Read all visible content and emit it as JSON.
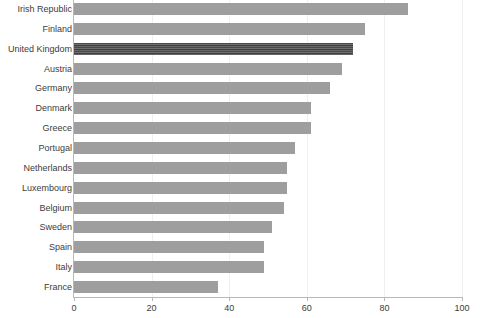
{
  "chart_data": {
    "type": "bar",
    "orientation": "horizontal",
    "title": "",
    "subtitle": "",
    "xlabel": "",
    "ylabel": "",
    "xlim": [
      0,
      100
    ],
    "ylim": null,
    "grid": true,
    "legend": null,
    "legend_position": "none",
    "xticks": [
      0,
      20,
      40,
      60,
      80,
      100
    ],
    "xtick_labels": [
      "0",
      "20",
      "40",
      "60",
      "80",
      "100"
    ],
    "categories": [
      "Irish Republic",
      "Finland",
      "United Kingdom",
      "Austria",
      "Germany",
      "Denmark",
      "Greece",
      "Portugal",
      "Netherlands",
      "Luxembourg",
      "Belgium",
      "Sweden",
      "Spain",
      "Italy",
      "France"
    ],
    "values": [
      86,
      75,
      72,
      69,
      66,
      61,
      61,
      57,
      55,
      55,
      54,
      51,
      49,
      49,
      37
    ],
    "highlighted_category": "United Kingdom",
    "bar_color": "#9e9e9e",
    "highlight_color": "#555555",
    "grid_color": "#efefef",
    "axis_color": "#b8b8b8",
    "label_color": "#3c3c3c",
    "background": "#ffffff"
  }
}
